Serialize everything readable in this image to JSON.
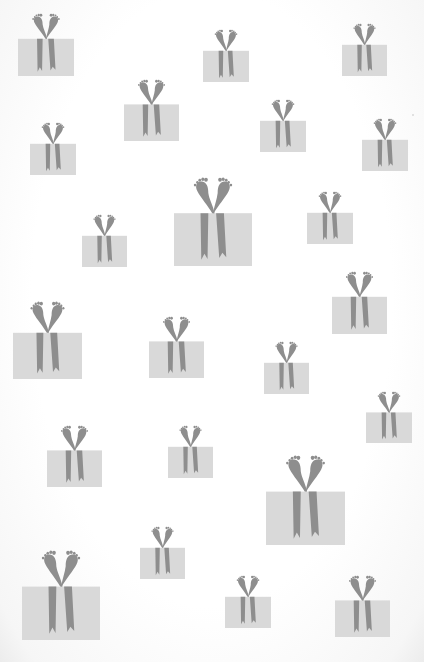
{
  "pattern": {
    "description": "Wrapping-paper pattern of gift boxes with footprint-shaped bows",
    "colors": {
      "background": "#fdfdfd",
      "box": "#d9d9d9",
      "ribbon": "#8e8e8e",
      "ribbon_tail_notch": "#fdfdfd"
    },
    "icon": "gift-box-with-feet-bow-icon",
    "gifts": [
      {
        "x": 18,
        "y": 14,
        "w": 56,
        "h": 62
      },
      {
        "x": 203,
        "y": 30,
        "w": 46,
        "h": 52
      },
      {
        "x": 342,
        "y": 24,
        "w": 45,
        "h": 52
      },
      {
        "x": 124,
        "y": 80,
        "w": 55,
        "h": 61
      },
      {
        "x": 260,
        "y": 100,
        "w": 46,
        "h": 52
      },
      {
        "x": 30,
        "y": 123,
        "w": 46,
        "h": 52
      },
      {
        "x": 362,
        "y": 119,
        "w": 46,
        "h": 52
      },
      {
        "x": 174,
        "y": 178,
        "w": 78,
        "h": 88
      },
      {
        "x": 307,
        "y": 192,
        "w": 46,
        "h": 52
      },
      {
        "x": 82,
        "y": 215,
        "w": 45,
        "h": 52
      },
      {
        "x": 332,
        "y": 272,
        "w": 55,
        "h": 62
      },
      {
        "x": 13,
        "y": 302,
        "w": 69,
        "h": 77
      },
      {
        "x": 149,
        "y": 317,
        "w": 55,
        "h": 61
      },
      {
        "x": 264,
        "y": 342,
        "w": 45,
        "h": 52
      },
      {
        "x": 366,
        "y": 392,
        "w": 46,
        "h": 51
      },
      {
        "x": 47,
        "y": 426,
        "w": 55,
        "h": 61
      },
      {
        "x": 168,
        "y": 426,
        "w": 45,
        "h": 52
      },
      {
        "x": 266,
        "y": 456,
        "w": 79,
        "h": 89
      },
      {
        "x": 140,
        "y": 527,
        "w": 45,
        "h": 52
      },
      {
        "x": 22,
        "y": 551,
        "w": 78,
        "h": 89
      },
      {
        "x": 225,
        "y": 576,
        "w": 46,
        "h": 52
      },
      {
        "x": 335,
        "y": 576,
        "w": 55,
        "h": 61
      }
    ],
    "specks": [
      {
        "x": 412,
        "y": 114
      }
    ]
  }
}
